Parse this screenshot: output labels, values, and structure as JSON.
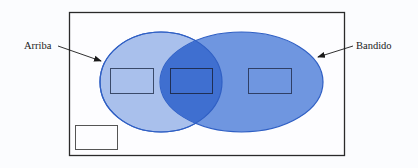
{
  "diagram": {
    "type": "venn",
    "labels": {
      "left": "Arriba",
      "right": "Bandido"
    },
    "colors": {
      "background": "#fbfcfe",
      "frame_stroke": "#2a2a2a",
      "left_fill": "#a9c0ec",
      "right_fill": "#6f96e0",
      "overlap_fill": "#3f6fd0",
      "ellipse_stroke": "#2f5fc4",
      "box_stroke": "#3a4a6a",
      "arrow": "#1a1a1a"
    },
    "regions": [
      {
        "name": "left-only",
        "has_box": true
      },
      {
        "name": "intersection",
        "has_box": true
      },
      {
        "name": "right-only",
        "has_box": true
      },
      {
        "name": "outside",
        "has_box": true
      }
    ]
  }
}
